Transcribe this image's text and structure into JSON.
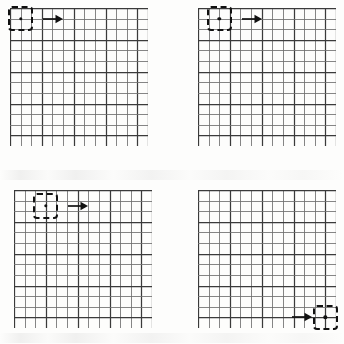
{
  "figure": {
    "title": "",
    "background_color": "#fdfdfc",
    "ink_color": "#111111",
    "grid_line_color": "#6f6f6f",
    "grid_major_color": "#3a3a3a"
  },
  "grid": {
    "columns": 13,
    "rows": 13,
    "major_every": 3
  },
  "panels": [
    {
      "id": "panel-top-left",
      "label": "",
      "x": 10,
      "y": 8,
      "width": 138,
      "height": 138,
      "box": {
        "col": 0,
        "row": 0,
        "cols": 2,
        "rows": 2
      },
      "dot": {
        "col": 1.0,
        "row": 1.0
      },
      "arrow": {
        "col": 3.1,
        "row": 1.0,
        "length": 20,
        "direction": "right"
      }
    },
    {
      "id": "panel-top-right",
      "label": "",
      "x": 198,
      "y": 8,
      "width": 138,
      "height": 138,
      "box": {
        "col": 1,
        "row": 0,
        "cols": 2,
        "rows": 2
      },
      "dot": {
        "col": 2.0,
        "row": 1.0
      },
      "arrow": {
        "col": 4.1,
        "row": 1.0,
        "length": 20,
        "direction": "right"
      }
    },
    {
      "id": "panel-bottom-left",
      "label": "",
      "x": 14,
      "y": 190,
      "width": 138,
      "height": 138,
      "box": {
        "col": 2,
        "row": 0.5,
        "cols": 2,
        "rows": 2
      },
      "dot": {
        "col": 3.0,
        "row": 1.5
      },
      "arrow": {
        "col": 5.1,
        "row": 1.5,
        "length": 20,
        "direction": "right"
      }
    },
    {
      "id": "panel-bottom-right",
      "label": "",
      "x": 198,
      "y": 190,
      "width": 138,
      "height": 138,
      "box": {
        "col": 11,
        "row": 11,
        "cols": 2,
        "rows": 2
      },
      "dot": {
        "col": 12.0,
        "row": 12.0
      },
      "arrow": {
        "col": 8.9,
        "row": 12.0,
        "length": 20,
        "direction": "right"
      }
    }
  ],
  "icons": {
    "arrow_right": "arrow-right-icon",
    "center_dot": "center-dot-icon",
    "selection_box": "dashed-selection-box"
  }
}
